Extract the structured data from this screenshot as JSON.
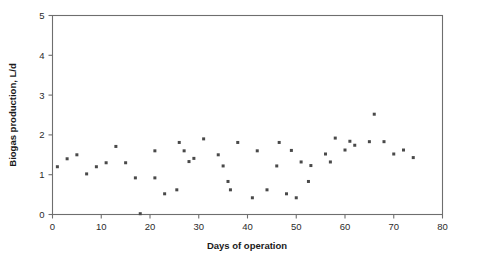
{
  "chart_data": {
    "type": "scatter",
    "title": "",
    "xlabel": "Days of operation",
    "ylabel": "Biogas production, L/d",
    "xlim": [
      0,
      80
    ],
    "ylim": [
      0,
      5
    ],
    "xticks": [
      0,
      10,
      20,
      30,
      40,
      50,
      60,
      70,
      80
    ],
    "yticks": [
      0,
      1,
      2,
      3,
      4,
      5
    ],
    "grid": false,
    "legend": null,
    "marker": {
      "shape": "square",
      "color": "#494949",
      "size": 3
    },
    "series": [
      {
        "name": "Biogas production",
        "points": [
          [
            1,
            1.2
          ],
          [
            3,
            1.4
          ],
          [
            5,
            1.5
          ],
          [
            7,
            1.02
          ],
          [
            9,
            1.2
          ],
          [
            11,
            1.3
          ],
          [
            13,
            1.71
          ],
          [
            15,
            1.3
          ],
          [
            17,
            0.92
          ],
          [
            18,
            0.02
          ],
          [
            21,
            0.92
          ],
          [
            21,
            1.6
          ],
          [
            23,
            0.52
          ],
          [
            25.5,
            0.62
          ],
          [
            26,
            1.81
          ],
          [
            27,
            1.6
          ],
          [
            28,
            1.33
          ],
          [
            29,
            1.41
          ],
          [
            31,
            1.9
          ],
          [
            34,
            1.5
          ],
          [
            35,
            1.22
          ],
          [
            36,
            0.83
          ],
          [
            36.5,
            0.62
          ],
          [
            38,
            1.81
          ],
          [
            41,
            0.42
          ],
          [
            42,
            1.6
          ],
          [
            44,
            0.62
          ],
          [
            46,
            1.22
          ],
          [
            46.5,
            1.81
          ],
          [
            48,
            0.52
          ],
          [
            49,
            1.61
          ],
          [
            50,
            0.42
          ],
          [
            51,
            1.32
          ],
          [
            52.5,
            0.83
          ],
          [
            53,
            1.23
          ],
          [
            56,
            1.52
          ],
          [
            57,
            1.32
          ],
          [
            58,
            1.92
          ],
          [
            60,
            1.62
          ],
          [
            61,
            1.84
          ],
          [
            62,
            1.74
          ],
          [
            65,
            1.83
          ],
          [
            66,
            2.52
          ],
          [
            68,
            1.83
          ],
          [
            70,
            1.52
          ],
          [
            72,
            1.62
          ],
          [
            74,
            1.43
          ]
        ]
      }
    ]
  },
  "axes": {
    "x_tick_labels": [
      "0",
      "10",
      "20",
      "30",
      "40",
      "50",
      "60",
      "70",
      "80"
    ],
    "y_tick_labels": [
      "0",
      "1",
      "2",
      "3",
      "4",
      "5"
    ],
    "x_axis_title": "Days of operation",
    "y_axis_title": "Biogas production, L/d"
  }
}
